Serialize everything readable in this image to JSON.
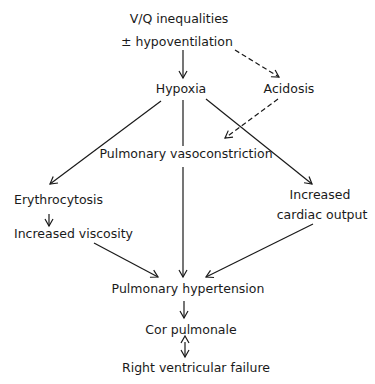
{
  "diagram": {
    "nodes": {
      "vq": "V/Q inequalities",
      "hypovent": "± hypoventilation",
      "hypoxia": "Hypoxia",
      "acidosis": "Acidosis",
      "vasoconstriction": "Pulmonary vasoconstriction",
      "erythrocytosis": "Erythrocytosis",
      "viscosity": "Increased viscosity",
      "increased": "Increased",
      "cardiac_output": "cardiac output",
      "pulm_htn": "Pulmonary hypertension",
      "cor_pulmonale": "Cor pulmonale",
      "rv_failure": "Right ventricular failure"
    },
    "edges": [
      {
        "from": "V/Q inequalities ± hypoventilation",
        "to": "Hypoxia",
        "style": "solid"
      },
      {
        "from": "V/Q inequalities ± hypoventilation",
        "to": "Acidosis",
        "style": "dashed"
      },
      {
        "from": "Hypoxia",
        "to": "Erythrocytosis",
        "style": "solid"
      },
      {
        "from": "Hypoxia",
        "to": "Pulmonary hypertension",
        "style": "solid"
      },
      {
        "from": "Hypoxia",
        "to": "Increased cardiac output",
        "style": "solid"
      },
      {
        "from": "Acidosis",
        "to": "Pulmonary vasoconstriction",
        "style": "dashed"
      },
      {
        "from": "Erythrocytosis",
        "to": "Increased viscosity",
        "style": "solid"
      },
      {
        "from": "Increased viscosity",
        "to": "Pulmonary hypertension",
        "style": "solid"
      },
      {
        "from": "Increased cardiac output",
        "to": "Pulmonary hypertension",
        "style": "solid"
      },
      {
        "from": "Pulmonary hypertension",
        "to": "Cor pulmonale",
        "style": "solid"
      },
      {
        "from": "Cor pulmonale",
        "to": "Right ventricular failure",
        "style": "bidirectional"
      }
    ],
    "colors": {
      "ink": "#1a1a1a",
      "background": "#ffffff"
    }
  }
}
